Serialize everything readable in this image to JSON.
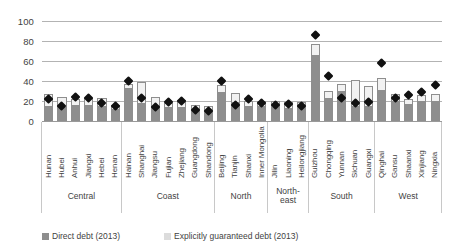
{
  "chart_data": {
    "type": "bar",
    "title": "",
    "subtitle": "",
    "xlabel": "",
    "ylabel": "",
    "ylim": [
      0,
      100
    ],
    "yticks": [
      0,
      20,
      40,
      60,
      80,
      100
    ],
    "grid": true,
    "stacked": true,
    "legend_position": "bottom",
    "legend": [
      {
        "name": "Direct debt (2013)",
        "color": "#8e8e8e",
        "swatch": "direct"
      },
      {
        "name": "Explicitly guaranteed debt (2013)",
        "color": "#dcdcdc",
        "swatch": "guaranteed"
      }
    ],
    "marker_series": {
      "name": "Total liability marker",
      "marker": "diamond",
      "color": "#111111"
    },
    "categories": [
      "Hunan",
      "Hubei",
      "Anhui",
      "Jiangxi",
      "Hebei",
      "Henan",
      "Hainan",
      "Shanghai",
      "Jiangsu",
      "Fujian",
      "Zhejiang",
      "Guangdong",
      "Shandong",
      "Beijing",
      "Tianjin",
      "Shanxi",
      "Inner Mongolia",
      "Jilin",
      "Liaoning",
      "Heilongjiang",
      "Guizhou",
      "Chongqing",
      "Yunnan",
      "Sichuan",
      "Guangxi",
      "Qinghai",
      "Gansu",
      "Shaanxi",
      "Xinjiang",
      "Ningxia"
    ],
    "groups": [
      {
        "label": "Central",
        "count": 6
      },
      {
        "label": "Coast",
        "count": 7
      },
      {
        "label": "North",
        "count": 4
      },
      {
        "label": "North-\neast",
        "count": 3
      },
      {
        "label": "South",
        "count": 5
      },
      {
        "label": "West",
        "count": 5
      }
    ],
    "series": [
      {
        "name": "Direct debt (2013)",
        "values": [
          14,
          13,
          15,
          15,
          14,
          11,
          32,
          17,
          12,
          13,
          13,
          10,
          9,
          28,
          18,
          14,
          14,
          13,
          12,
          13,
          65,
          22,
          29,
          14,
          14,
          30,
          19,
          16,
          19,
          19
        ]
      },
      {
        "name": "Explicitly guaranteed debt (2013)",
        "values": [
          13,
          11,
          7,
          8,
          9,
          5,
          5,
          22,
          12,
          5,
          8,
          6,
          6,
          8,
          10,
          6,
          6,
          7,
          7,
          6,
          12,
          8,
          8,
          27,
          21,
          13,
          8,
          6,
          7,
          8
        ]
      }
    ],
    "markers": [
      22,
      15,
      24,
      23,
      18,
      15,
      40,
      23,
      14,
      19,
      20,
      11,
      10,
      40,
      16,
      22,
      18,
      16,
      17,
      15,
      86,
      45,
      23,
      18,
      19,
      58,
      23,
      26,
      29,
      36
    ]
  }
}
